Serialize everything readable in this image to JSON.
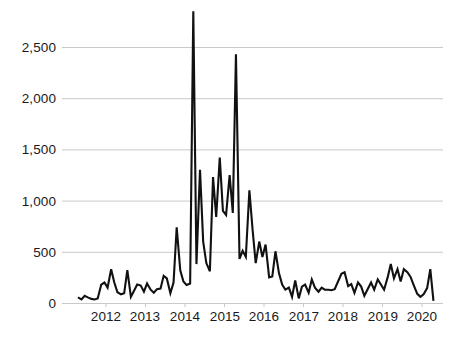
{
  "chart_data": {
    "type": "line",
    "title": "",
    "xlabel": "",
    "ylabel": "",
    "ylim": [
      0,
      2900
    ],
    "yticks": [
      0,
      500,
      1000,
      1500,
      2000,
      2500
    ],
    "ytick_labels": [
      "0",
      "500",
      "1,000",
      "1,500",
      "2,000",
      "2,500"
    ],
    "xticks": [
      2012,
      2013,
      2014,
      2015,
      2016,
      2017,
      2018,
      2019,
      2020
    ],
    "xtick_labels": [
      "2012",
      "2013",
      "2014",
      "2015",
      "2016",
      "2017",
      "2018",
      "2019",
      "2020"
    ],
    "xlim": [
      2011.25,
      2020.55
    ],
    "grid": "horizontal",
    "legend": "none",
    "line_color": "#111111",
    "grid_color": "#c9c9c9",
    "series": [
      {
        "name": "monthly value",
        "x": [
          2011.29,
          2011.38,
          2011.46,
          2011.54,
          2011.63,
          2011.71,
          2011.79,
          2011.88,
          2011.96,
          2012.04,
          2012.13,
          2012.21,
          2012.29,
          2012.38,
          2012.46,
          2012.54,
          2012.63,
          2012.71,
          2012.79,
          2012.88,
          2012.96,
          2013.04,
          2013.13,
          2013.21,
          2013.29,
          2013.38,
          2013.46,
          2013.54,
          2013.63,
          2013.71,
          2013.79,
          2013.88,
          2013.96,
          2014.04,
          2014.13,
          2014.21,
          2014.29,
          2014.38,
          2014.46,
          2014.54,
          2014.63,
          2014.71,
          2014.79,
          2014.88,
          2014.96,
          2015.04,
          2015.13,
          2015.21,
          2015.29,
          2015.38,
          2015.46,
          2015.54,
          2015.63,
          2015.71,
          2015.79,
          2015.88,
          2015.96,
          2016.04,
          2016.13,
          2016.21,
          2016.29,
          2016.38,
          2016.46,
          2016.54,
          2016.63,
          2016.71,
          2016.79,
          2016.88,
          2016.96,
          2017.04,
          2017.13,
          2017.21,
          2017.29,
          2017.38,
          2017.46,
          2017.54,
          2017.63,
          2017.71,
          2017.79,
          2017.88,
          2017.96,
          2018.04,
          2018.13,
          2018.21,
          2018.29,
          2018.38,
          2018.46,
          2018.54,
          2018.63,
          2018.71,
          2018.79,
          2018.88,
          2018.96,
          2019.04,
          2019.13,
          2019.21,
          2019.29,
          2019.38,
          2019.46,
          2019.54,
          2019.63,
          2019.71,
          2019.79,
          2019.88,
          2019.96,
          2020.04,
          2020.13,
          2020.21,
          2020.29
        ],
        "values": [
          55,
          35,
          70,
          55,
          40,
          35,
          45,
          180,
          200,
          150,
          330,
          200,
          105,
          85,
          95,
          320,
          60,
          120,
          180,
          170,
          110,
          190,
          130,
          100,
          135,
          140,
          265,
          240,
          95,
          200,
          740,
          320,
          210,
          175,
          190,
          2850,
          380,
          1300,
          600,
          390,
          310,
          1230,
          840,
          1420,
          900,
          860,
          1250,
          880,
          2430,
          430,
          510,
          450,
          1100,
          720,
          390,
          600,
          450,
          570,
          250,
          260,
          505,
          290,
          180,
          130,
          150,
          60,
          220,
          45,
          160,
          180,
          100,
          230,
          150,
          110,
          150,
          130,
          130,
          125,
          135,
          215,
          285,
          300,
          165,
          185,
          100,
          200,
          160,
          70,
          140,
          200,
          130,
          230,
          180,
          130,
          250,
          380,
          240,
          330,
          210,
          330,
          300,
          255,
          175,
          90,
          60,
          85,
          145,
          330,
          20
        ]
      }
    ]
  },
  "axis": {
    "y_tick_labels": [
      "2,500",
      "2,000",
      "1,500",
      "1,000",
      "500",
      "0"
    ],
    "x_tick_labels": [
      "2012",
      "2013",
      "2014",
      "2015",
      "2016",
      "2017",
      "2018",
      "2019",
      "2020"
    ]
  }
}
